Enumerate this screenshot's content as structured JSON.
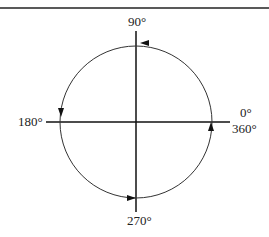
{
  "diagram": {
    "title": "",
    "labels": {
      "top": "90°",
      "left": "180°",
      "right_upper": "0°",
      "right_lower": "360°",
      "bottom": "270°"
    },
    "colors": {
      "line": "#111111",
      "background": "#ffffff"
    }
  }
}
